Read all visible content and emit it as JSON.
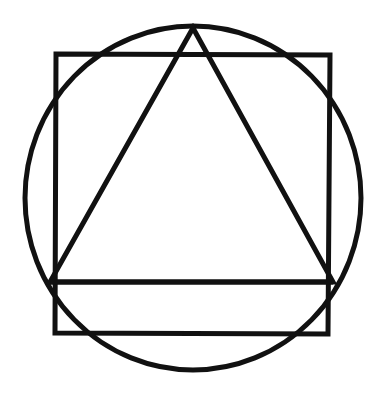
{
  "diagram": {
    "background": "#ffffff",
    "stroke_color": "#111111",
    "stroke_width": 5,
    "shapes": {
      "circle": {
        "cx": 193,
        "cy": 198,
        "rx": 168,
        "ry": 172
      },
      "square": {
        "x1": 56,
        "y1": 54,
        "x2": 330,
        "y2": 333
      },
      "triangle": {
        "apex": [
          193,
          28
        ],
        "base_left": [
          50,
          282
        ],
        "base_right": [
          333,
          282
        ]
      },
      "horizontal_line": {
        "x1": 50,
        "y1": 282,
        "x2": 333,
        "y2": 282
      }
    }
  }
}
